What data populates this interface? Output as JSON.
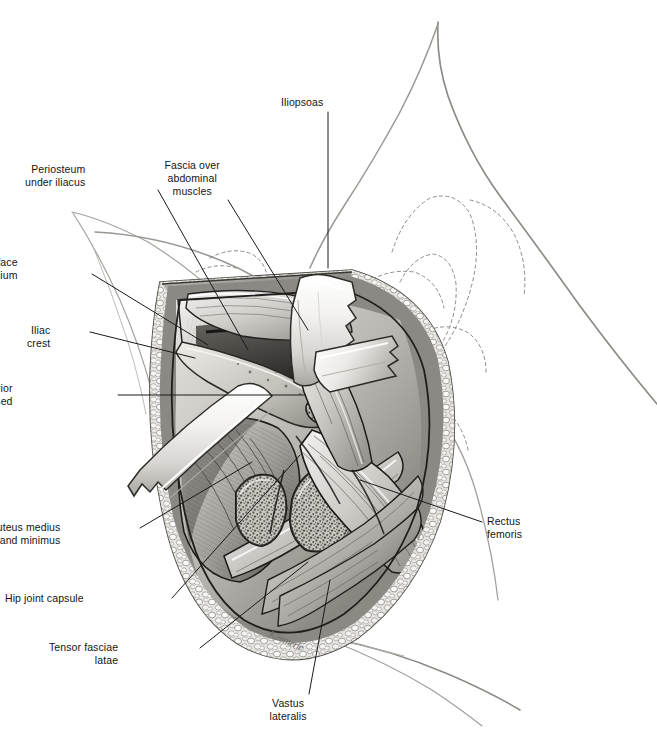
{
  "figure": {
    "background_color": "#ffffff",
    "label_color": "#141414",
    "leader_line_color": "#1a1a1a",
    "outline_color": "#8a8a8a",
    "signature": "Kimmerle"
  },
  "labels": [
    {
      "id": "iliopsoas",
      "text": "Iliopsoas",
      "side": "top",
      "align": "center",
      "x": 302,
      "y": 96,
      "leader": [
        [
          328,
          112
        ],
        [
          328,
          268
        ]
      ]
    },
    {
      "id": "periosteum-under-iliacus",
      "text": "Periosteum\nunder iliacus",
      "side": "left",
      "align": "right",
      "x": 85,
      "y": 163,
      "leader": [
        [
          158,
          190
        ],
        [
          248,
          350
        ]
      ]
    },
    {
      "id": "fascia-over-abdominal-muscles",
      "text": "Fascia over\nabdominal\nmuscles",
      "side": "top",
      "align": "center",
      "x": 192,
      "y": 159,
      "leader": [
        [
          228,
          200
        ],
        [
          308,
          330
        ]
      ]
    },
    {
      "id": "inner-surface-of-ilium",
      "text": "Inner surface\nof ilium",
      "side": "left",
      "align": "right",
      "x": 18,
      "y": 256,
      "leader": [
        [
          92,
          274
        ],
        [
          208,
          345
        ]
      ]
    },
    {
      "id": "iliac-crest",
      "text": "Iliac\ncrest",
      "side": "left",
      "align": "right",
      "x": 50,
      "y": 324,
      "leader": [
        [
          90,
          332
        ],
        [
          195,
          358
        ]
      ]
    },
    {
      "id": "anterior-superior-iliac-spine-excised",
      "text": "Anterior superior\niliac spine excised",
      "side": "left",
      "align": "right",
      "x": 13,
      "y": 382,
      "leader": [
        [
          118,
          395
        ],
        [
          305,
          395
        ]
      ]
    },
    {
      "id": "gluteus-medius-and-minimus",
      "text": "Gluteus medius\nand minimus",
      "side": "left",
      "align": "right",
      "x": 60,
      "y": 521,
      "leader": [
        [
          140,
          528
        ],
        [
          252,
          462
        ]
      ]
    },
    {
      "id": "hip-joint-capsule",
      "text": "Hip joint capsule",
      "side": "left",
      "align": "right",
      "x": 84,
      "y": 592,
      "leader": [
        [
          172,
          598
        ],
        [
          300,
          455
        ]
      ]
    },
    {
      "id": "tensor-fasciae-latae",
      "text": "Tensor fasciae\nlatae",
      "side": "left",
      "align": "right",
      "x": 118,
      "y": 641,
      "leader": [
        [
          200,
          648
        ],
        [
          308,
          562
        ]
      ]
    },
    {
      "id": "vastus-lateralis",
      "text": "Vastus\nlateralis",
      "side": "bottom",
      "align": "center",
      "x": 288,
      "y": 697,
      "leader": [
        [
          309,
          694
        ],
        [
          330,
          580
        ]
      ]
    },
    {
      "id": "rectus-femoris",
      "text": "Rectus\nfemoris",
      "side": "right",
      "align": "left",
      "x": 487,
      "y": 515,
      "leader": [
        [
          482,
          522
        ],
        [
          360,
          480
        ]
      ]
    }
  ]
}
